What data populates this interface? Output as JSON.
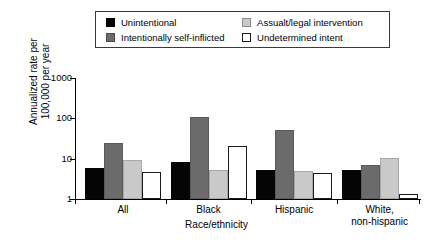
{
  "chart_data": {
    "type": "bar",
    "title": "",
    "subtitle": "",
    "xlabel": "Race/ethnicity",
    "ylabel_line1": "Annualized rate per",
    "ylabel_line2": "100,000 per year",
    "yscale": "log",
    "ylim": [
      1,
      1000
    ],
    "ytick_labels": [
      "1000",
      "100",
      "10",
      "1"
    ],
    "ytick_values": [
      1000,
      100,
      10,
      1
    ],
    "grid": false,
    "legend_position": "top-center",
    "categories": [
      "All",
      "Black",
      "Hispanic",
      "White,\nnon-hispanic"
    ],
    "category_labels": [
      {
        "line1": "All",
        "line2": ""
      },
      {
        "line1": "Black",
        "line2": ""
      },
      {
        "line1": "Hispanic",
        "line2": ""
      },
      {
        "line1": "White,",
        "line2": "non-hispanic"
      }
    ],
    "series": [
      {
        "name": "Unintentional",
        "color": "#050505",
        "swatch": "sw-black",
        "bar_class": "b-black",
        "values": [
          5.8,
          8.3,
          5.1,
          5.1
        ]
      },
      {
        "name": "Intentionally self-inflicted",
        "color": "#6b6b6b",
        "swatch": "sw-dgray",
        "bar_class": "b-dgray",
        "values": [
          25,
          106,
          50,
          7.1
        ]
      },
      {
        "name": "Assualt/legal intervention",
        "color": "#c9c9c9",
        "swatch": "sw-lgray",
        "bar_class": "b-lgray",
        "values": [
          9.3,
          5.1,
          5.0,
          10.6
        ]
      },
      {
        "name": "Undetermined intent",
        "color": "#ffffff",
        "swatch": "sw-white",
        "bar_class": "b-white",
        "values": [
          4.7,
          20.5,
          4.3,
          1.35
        ]
      }
    ]
  },
  "legend": {
    "entries": [
      {
        "label": "Unintentional",
        "swatch": "sw-black"
      },
      {
        "label": "Assualt/legal intervention",
        "swatch": "sw-lgray"
      },
      {
        "label": "Intentionally self-inflicted",
        "swatch": "sw-dgray"
      },
      {
        "label": "Undetermined intent",
        "swatch": "sw-white"
      }
    ]
  }
}
